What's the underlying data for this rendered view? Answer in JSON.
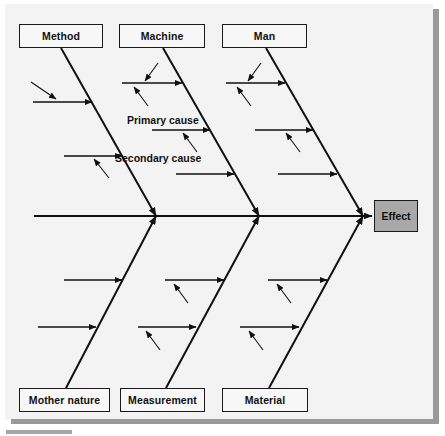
{
  "diagram": {
    "type": "fishbone-ishikawa-cause-and-effect",
    "spine": {
      "x_start": 34,
      "x_end": 372,
      "y": 216,
      "head_arrow": true
    },
    "effect": {
      "label": "Effect",
      "x": 374,
      "y": 200,
      "width": 44,
      "height": 32,
      "fill": "#a8a8a8",
      "stroke": "#1a1a1a"
    },
    "annotations": [
      {
        "name": "primary-cause-label",
        "label": "Primary cause",
        "x": 127,
        "y": 114
      },
      {
        "name": "secondary-cause-label",
        "label": "Secondary cause",
        "x": 115,
        "y": 152
      }
    ],
    "categories_top": [
      {
        "name": "method",
        "label": "Method",
        "box": {
          "x": 19,
          "y": 24,
          "width": 84,
          "height": 24
        },
        "bone": {
          "x1": 61,
          "y1": 48,
          "x2": 156,
          "y2": 216
        }
      },
      {
        "name": "machine",
        "label": "Machine",
        "box": {
          "x": 119,
          "y": 24,
          "width": 86,
          "height": 24
        },
        "bone": {
          "x1": 163,
          "y1": 48,
          "x2": 259,
          "y2": 216
        }
      },
      {
        "name": "man",
        "label": "Man",
        "box": {
          "x": 222,
          "y": 24,
          "width": 85,
          "height": 24
        },
        "bone": {
          "x1": 266,
          "y1": 48,
          "x2": 363,
          "y2": 216
        }
      }
    ],
    "categories_bottom": [
      {
        "name": "mother-nature",
        "label": "Mother nature",
        "box": {
          "x": 19,
          "y": 388,
          "width": 91,
          "height": 24
        },
        "bone": {
          "x1": 66,
          "y1": 388,
          "x2": 156,
          "y2": 216
        }
      },
      {
        "name": "measurement",
        "label": "Measurement",
        "box": {
          "x": 120,
          "y": 388,
          "width": 85,
          "height": 24
        },
        "bone": {
          "x1": 166,
          "y1": 388,
          "x2": 259,
          "y2": 216
        }
      },
      {
        "name": "material",
        "label": "Material",
        "box": {
          "x": 222,
          "y": 388,
          "width": 86,
          "height": 24
        },
        "bone": {
          "x1": 269,
          "y1": 388,
          "x2": 363,
          "y2": 216
        }
      }
    ],
    "primary_arrows": [
      {
        "branch": "method",
        "x1": 33,
        "y1": 102,
        "x2": 92,
        "y2": 102
      },
      {
        "branch": "method",
        "x1": 64,
        "y1": 156,
        "x2": 122,
        "y2": 156
      },
      {
        "branch": "machine",
        "x1": 122,
        "y1": 83,
        "x2": 182,
        "y2": 83
      },
      {
        "branch": "machine",
        "x1": 152,
        "y1": 130,
        "x2": 210,
        "y2": 130
      },
      {
        "branch": "machine",
        "x1": 176,
        "y1": 174,
        "x2": 234,
        "y2": 174
      },
      {
        "branch": "man",
        "x1": 226,
        "y1": 83,
        "x2": 285,
        "y2": 83
      },
      {
        "branch": "man",
        "x1": 255,
        "y1": 130,
        "x2": 313,
        "y2": 130
      },
      {
        "branch": "man",
        "x1": 278,
        "y1": 174,
        "x2": 337,
        "y2": 174
      },
      {
        "branch": "mother-nature",
        "x1": 64,
        "y1": 280,
        "x2": 122,
        "y2": 280
      },
      {
        "branch": "mother-nature",
        "x1": 38,
        "y1": 327,
        "x2": 96,
        "y2": 327
      },
      {
        "branch": "measurement",
        "x1": 165,
        "y1": 280,
        "x2": 224,
        "y2": 280
      },
      {
        "branch": "measurement",
        "x1": 138,
        "y1": 327,
        "x2": 196,
        "y2": 327
      },
      {
        "branch": "material",
        "x1": 268,
        "y1": 280,
        "x2": 327,
        "y2": 280
      },
      {
        "branch": "material",
        "x1": 240,
        "y1": 327,
        "x2": 299,
        "y2": 327
      }
    ],
    "secondary_arrows": [
      {
        "branch": "method",
        "x1": 31,
        "y1": 82,
        "x2": 56,
        "y2": 99,
        "direction": "down-right"
      },
      {
        "branch": "method",
        "x1": 109,
        "y1": 178,
        "x2": 94,
        "y2": 159,
        "direction": "up-left"
      },
      {
        "branch": "machine",
        "x1": 158,
        "y1": 63,
        "x2": 145,
        "y2": 81,
        "direction": "down-left"
      },
      {
        "branch": "machine",
        "x1": 148,
        "y1": 106,
        "x2": 134,
        "y2": 87,
        "direction": "up-left"
      },
      {
        "branch": "machine",
        "x1": 197,
        "y1": 152,
        "x2": 183,
        "y2": 133,
        "direction": "up-left"
      },
      {
        "branch": "man",
        "x1": 261,
        "y1": 63,
        "x2": 248,
        "y2": 81,
        "direction": "down-left"
      },
      {
        "branch": "man",
        "x1": 251,
        "y1": 106,
        "x2": 237,
        "y2": 87,
        "direction": "up-left"
      },
      {
        "branch": "man",
        "x1": 300,
        "y1": 152,
        "x2": 286,
        "y2": 133,
        "direction": "up-left"
      },
      {
        "branch": "measurement",
        "x1": 188,
        "y1": 303,
        "x2": 174,
        "y2": 284,
        "direction": "up-left"
      },
      {
        "branch": "measurement",
        "x1": 160,
        "y1": 350,
        "x2": 146,
        "y2": 331,
        "direction": "up-left"
      },
      {
        "branch": "material",
        "x1": 291,
        "y1": 303,
        "x2": 277,
        "y2": 284,
        "direction": "up-left"
      },
      {
        "branch": "material",
        "x1": 263,
        "y1": 350,
        "x2": 249,
        "y2": 331,
        "direction": "up-left"
      }
    ]
  }
}
